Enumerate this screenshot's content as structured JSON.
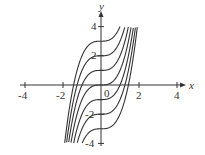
{
  "chart_data": {
    "type": "line",
    "title": "",
    "xlabel": "x",
    "ylabel": "y",
    "xlim": [
      -4,
      4
    ],
    "ylim": [
      -4,
      4
    ],
    "x_ticks": [
      "-4",
      "-2",
      "0",
      "2",
      "4"
    ],
    "y_ticks": [
      "4",
      "2",
      "-2",
      "-4"
    ],
    "grid": false,
    "legend": null,
    "function": "y = x^3 + C",
    "series": [
      {
        "name": "C=3",
        "C": 3
      },
      {
        "name": "C=2",
        "C": 2
      },
      {
        "name": "C=1",
        "C": 1
      },
      {
        "name": "C=0",
        "C": 0
      },
      {
        "name": "C=-1",
        "C": -1
      },
      {
        "name": "C=-2",
        "C": -2
      },
      {
        "name": "C=-3",
        "C": -3
      }
    ]
  },
  "labels": {
    "x": "x",
    "y": "y",
    "origin": "0",
    "xt_m4": "-4",
    "xt_m2": "-2",
    "xt_2": "2",
    "xt_4": "4",
    "yt_4": "4",
    "yt_2": "2",
    "yt_m2": "-2",
    "yt_m4": "-4"
  }
}
